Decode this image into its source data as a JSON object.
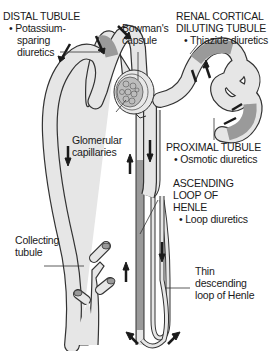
{
  "labels": {
    "distal_tubule": {
      "heading": "DISTAL TUBULE",
      "bullet": "• Potassium-",
      "line2": "sparing",
      "line3": "diuretics"
    },
    "bowmans_capsule": {
      "line1": "Bowman's",
      "line2": "capsule"
    },
    "renal_cortical": {
      "line1": "RENAL CORTICAL",
      "line2": "DILUTING TUBULE",
      "bullet": "• Thiazide diuretics"
    },
    "glomerular_capillaries": {
      "line1": "Glomerular",
      "line2": "capillaries"
    },
    "proximal_tubule": {
      "heading": "PROXIMAL TUBULE",
      "bullet": "• Osmotic diuretics"
    },
    "ascending_loop": {
      "line1": "ASCENDING",
      "line2": "LOOP OF",
      "line3": "HENLE",
      "bullet": "• Loop diuretics"
    },
    "collecting_tubule": {
      "line1": "Collecting",
      "line2": "tubule"
    },
    "thin_descending": {
      "line1": "Thin",
      "line2": "descending",
      "line3": "loop of Henle"
    }
  },
  "colors": {
    "tubule_fill": "#e6e6e6",
    "site_fill": "#9a9a9a",
    "outline": "#333333",
    "arrow": "#1a1a1a"
  }
}
